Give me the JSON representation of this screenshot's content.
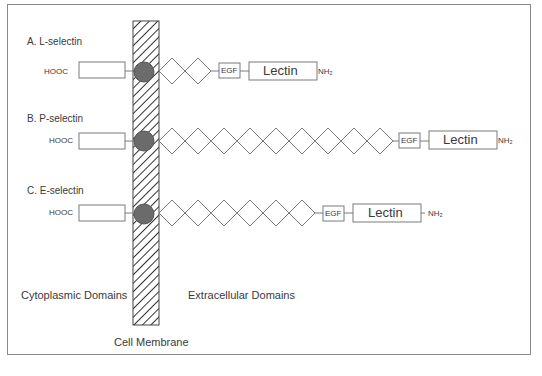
{
  "diagram": {
    "colors": {
      "line": "#7a7a7a",
      "transmembrane_circle": "#6b6b6b",
      "membrane_hatch": "#333333",
      "frame_border": "#8a8a8a"
    },
    "membrane": {
      "label": "Cell Membrane"
    },
    "regions": {
      "cytoplasmic": "Cytoplasmic Domains",
      "extracellular": "Extracellular Domains"
    },
    "rows": [
      {
        "label": "A.  L-selectin",
        "cterm": "HOOC",
        "repeats": 2,
        "egf": "EGF",
        "lectin": "Lectin",
        "nterm": "NH₂"
      },
      {
        "label": "B.  P-selectin",
        "cterm": "HOOC",
        "repeats": 9,
        "egf": "EGF",
        "lectin": "Lectin",
        "nterm": "NH₂"
      },
      {
        "label": "C.  E-selectin",
        "cterm": "HOOC",
        "repeats": 6,
        "egf": "EGF",
        "lectin": "Lectin",
        "nterm": "NH₂"
      }
    ]
  }
}
